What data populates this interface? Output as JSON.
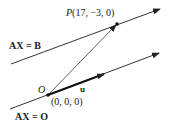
{
  "diagram": {
    "upper_line_label": "AX = B",
    "lower_line_label": "AX = O",
    "point_P": {
      "name": "P",
      "coords": "(17, −3, 0)"
    },
    "point_O": {
      "name": "O",
      "coords": "(0, 0, 0)"
    },
    "vector_u": {
      "name": "u"
    },
    "colors": {
      "line": "#333333",
      "text": "#1a1a1a"
    }
  }
}
